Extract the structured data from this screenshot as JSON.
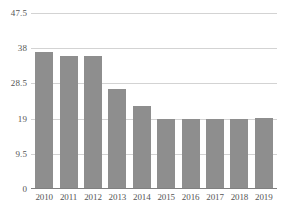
{
  "chart_data": {
    "type": "bar",
    "title": "",
    "subtitle": "",
    "xlabel": "",
    "ylabel": "",
    "categories": [
      "2010",
      "2011",
      "2012",
      "2013",
      "2014",
      "2015",
      "2016",
      "2017",
      "2018",
      "2019"
    ],
    "values": [
      37,
      36,
      36,
      27,
      22.5,
      19,
      18.8,
      18.9,
      19,
      19.3
    ],
    "series": [
      {
        "name": "",
        "values": [
          37,
          36,
          36,
          27,
          22.5,
          19,
          18.8,
          18.9,
          19,
          19.3
        ]
      }
    ],
    "ylim": [
      0,
      47.5
    ],
    "yticks": [
      0,
      9.5,
      19,
      28.5,
      38,
      47.5
    ],
    "ytick_labels": [
      "0",
      "9.5",
      "19",
      "28.5",
      "38",
      "47.5"
    ],
    "xtick_labels": [
      "2010",
      "2011",
      "2012",
      "2013",
      "2014",
      "2015",
      "2016",
      "2017",
      "2018",
      "2019"
    ],
    "grid": true,
    "grid_axis": "y",
    "legend": false,
    "legend_position": "none",
    "bar_color": "#8e8e8e",
    "gridline_color": "#d3d3d3",
    "axis_color": "#808080",
    "tick_label_color": "#555555",
    "background_color": "#ffffff"
  }
}
